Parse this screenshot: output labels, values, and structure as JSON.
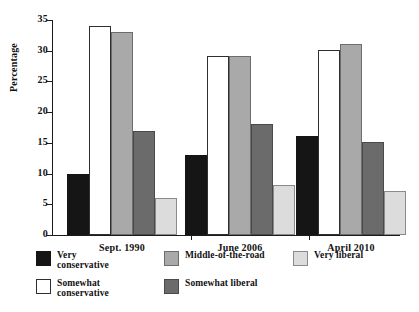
{
  "chart_data": {
    "type": "bar",
    "title": "",
    "subtitle": "",
    "xlabel": "",
    "ylabel": "Percentage",
    "ylim": [
      0,
      35
    ],
    "yticks": [
      0,
      5,
      10,
      15,
      20,
      25,
      30,
      35
    ],
    "ytick_labels": [
      "0",
      "5",
      "10",
      "15",
      "20",
      "25",
      "30",
      "35"
    ],
    "grid": false,
    "legend_position": "below-axes",
    "categories": [
      "Sept. 1990",
      "June 2006",
      "April 2010"
    ],
    "series": [
      {
        "name": "Very conservative",
        "color": "#151515",
        "values": [
          10.0,
          13.1,
          16.1
        ]
      },
      {
        "name": "Somewhat conservative",
        "color": "#ffffff",
        "values": [
          34.1,
          29.1,
          30.1
        ]
      },
      {
        "name": "Middle-of-the-road",
        "color": "#a9a9a9",
        "values": [
          33.1,
          29.1,
          31.1
        ]
      },
      {
        "name": "Somewhat liberal",
        "color": "#6b6b6b",
        "values": [
          17.0,
          18.1,
          15.1
        ]
      },
      {
        "name": "Very liberal",
        "color": "#dcdcdc",
        "values": [
          6.1,
          8.2,
          7.2
        ]
      }
    ]
  },
  "legend": {
    "entries": [
      {
        "label": "Very\nconservative",
        "swatch": "c0"
      },
      {
        "label": "Somewhat\nconservative",
        "swatch": "c1"
      },
      {
        "label": "Middle-of-the-road",
        "swatch": "c2"
      },
      {
        "label": "Somewhat liberal",
        "swatch": "c3"
      },
      {
        "label": "Very liberal",
        "swatch": "c4"
      }
    ]
  }
}
